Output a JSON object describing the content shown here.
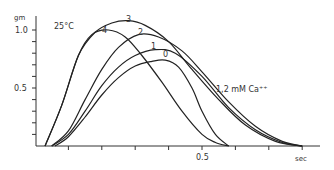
{
  "chart_data": {
    "type": "line",
    "title": "",
    "annotations": [
      "25°C",
      "1,2 mM Ca++"
    ],
    "xlabel": "sec",
    "ylabel": "gm",
    "xlim": [
      0,
      0.8
    ],
    "ylim": [
      0,
      1.1
    ],
    "x_ticks": [
      0.1,
      0.2,
      0.3,
      0.4,
      0.5,
      0.6,
      0.7,
      0.8
    ],
    "x_tick_labels": {
      "0.5": "0.5",
      "0.8": "sec"
    },
    "y_ticks": [
      0.1,
      0.2,
      0.3,
      0.4,
      0.5,
      0.6,
      0.7,
      0.8,
      0.9,
      1.0
    ],
    "y_tick_labels": {
      "0.5": "0.5",
      "1.0": "1.0"
    },
    "grid": false,
    "legend": "inline curve labels",
    "series": [
      {
        "name": "0",
        "x": [
          0.06,
          0.1,
          0.15,
          0.2,
          0.25,
          0.3,
          0.35,
          0.39,
          0.43,
          0.47,
          0.5,
          0.54,
          0.58
        ],
        "y": [
          0.0,
          0.08,
          0.25,
          0.44,
          0.59,
          0.69,
          0.73,
          0.74,
          0.68,
          0.5,
          0.3,
          0.1,
          0.0
        ]
      },
      {
        "name": "1",
        "x": [
          0.05,
          0.1,
          0.15,
          0.2,
          0.25,
          0.3,
          0.36,
          0.42,
          0.5,
          0.58,
          0.66,
          0.74,
          0.8
        ],
        "y": [
          0.0,
          0.1,
          0.3,
          0.52,
          0.68,
          0.78,
          0.83,
          0.8,
          0.6,
          0.33,
          0.14,
          0.03,
          0.0
        ]
      },
      {
        "name": "2",
        "x": [
          0.05,
          0.1,
          0.15,
          0.2,
          0.25,
          0.31,
          0.37,
          0.44,
          0.5,
          0.58,
          0.66,
          0.74,
          0.8
        ],
        "y": [
          0.0,
          0.13,
          0.4,
          0.66,
          0.85,
          0.96,
          0.94,
          0.82,
          0.64,
          0.38,
          0.17,
          0.04,
          0.0
        ]
      },
      {
        "name": "3",
        "x": [
          0.03,
          0.08,
          0.13,
          0.18,
          0.23,
          0.28,
          0.33,
          0.4,
          0.47,
          0.55,
          0.63,
          0.72,
          0.8
        ],
        "y": [
          0.0,
          0.35,
          0.78,
          0.98,
          1.06,
          1.08,
          1.04,
          0.9,
          0.66,
          0.4,
          0.18,
          0.04,
          0.0
        ]
      },
      {
        "name": "4",
        "x": [
          0.03,
          0.08,
          0.13,
          0.17,
          0.22,
          0.27,
          0.32,
          0.38,
          0.44,
          0.5,
          0.54,
          0.58
        ],
        "y": [
          0.0,
          0.35,
          0.78,
          0.96,
          1.0,
          0.94,
          0.78,
          0.55,
          0.3,
          0.1,
          0.03,
          0.0
        ]
      }
    ]
  },
  "axis": {
    "y_unit": "gm",
    "y_top_label": "1.0",
    "y_mid_label": "0.5",
    "x_mid_label": "0.5",
    "x_unit": "sec"
  },
  "annotations": {
    "temperature": "25°C",
    "concentration": "1,2 mM Ca⁺⁺"
  },
  "curve_labels": [
    "0",
    "1",
    "2",
    "3",
    "4"
  ]
}
